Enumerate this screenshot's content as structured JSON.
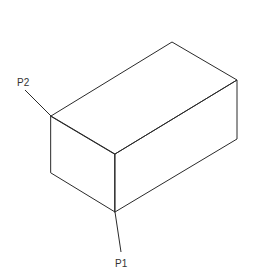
{
  "diagram": {
    "type": "isometric-box",
    "stroke_color": "#2a2a2a",
    "labels": {
      "p1": "P1",
      "p2": "P2"
    }
  }
}
